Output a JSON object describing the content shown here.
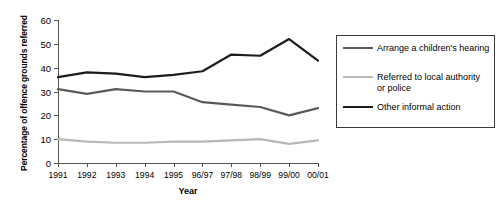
{
  "chart_data": {
    "type": "line",
    "title": "",
    "xlabel": "Year",
    "ylabel": "Percentage of offence grounds referred",
    "categories": [
      "1991",
      "1992",
      "1993",
      "1994",
      "1995",
      "96/97",
      "97/98",
      "98/99",
      "99/00",
      "00/01"
    ],
    "ylim": [
      0,
      60
    ],
    "yticks": [
      0,
      10,
      20,
      30,
      40,
      50,
      60
    ],
    "xlim": [
      0,
      9
    ],
    "grid": false,
    "legend_position": "right",
    "series": [
      {
        "name": "Arrange a children's hearing",
        "color": "#5a5a5a",
        "values": [
          31,
          29,
          31,
          30,
          30,
          25.5,
          24.5,
          23.5,
          20,
          23
        ]
      },
      {
        "name": "Referred to local authority or police",
        "color": "#b8b8b8",
        "values": [
          10,
          9,
          8.5,
          8.5,
          9,
          9,
          9.5,
          10,
          8,
          9.5
        ]
      },
      {
        "name": "Other informal action",
        "color": "#1c1c1c",
        "values": [
          36,
          38,
          37.5,
          36,
          37,
          38.5,
          45.5,
          45,
          52,
          43
        ]
      }
    ]
  },
  "legend": {
    "items": [
      {
        "label": "Arrange a children's hearing"
      },
      {
        "label": "Referred to local authority or police"
      },
      {
        "label": "Other informal action"
      }
    ]
  }
}
